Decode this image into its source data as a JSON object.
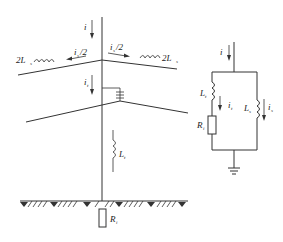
{
  "figure": {
    "type": "circuit-diagram"
  },
  "tower_diagram": {
    "stroke_current": {
      "symbol": "i",
      "subscript": ""
    },
    "left_branch": {
      "inductance": {
        "symbol": "2L",
        "subscript": "s"
      },
      "current": {
        "symbol": "i",
        "subscript": "s",
        "suffix": "/2"
      }
    },
    "right_branch": {
      "inductance": {
        "symbol": "2L",
        "subscript": "s"
      },
      "current": {
        "symbol": "i",
        "subscript": "s",
        "suffix": "/2"
      }
    },
    "tower_current": {
      "symbol": "i",
      "subscript": "t"
    },
    "tower_inductance": {
      "symbol": "L",
      "subscript": "t"
    },
    "grounding_resistance": {
      "symbol": "R",
      "subscript": "i"
    },
    "insulator": "insulator-string-icon",
    "ground": "ground-hatch"
  },
  "equivalent_circuit": {
    "input_current": {
      "symbol": "i",
      "subscript": ""
    },
    "left_branch": {
      "inductance": {
        "symbol": "L",
        "subscript": "t"
      },
      "current": {
        "symbol": "i",
        "subscript": "t"
      },
      "resistance": {
        "symbol": "R",
        "subscript": "i"
      }
    },
    "right_branch": {
      "inductance": {
        "symbol": "L",
        "subscript": "s"
      },
      "current": {
        "symbol": "i",
        "subscript": "s"
      }
    },
    "ground": "ground-symbol-icon"
  },
  "colors": {
    "line": "#333333",
    "background": "#ffffff"
  }
}
